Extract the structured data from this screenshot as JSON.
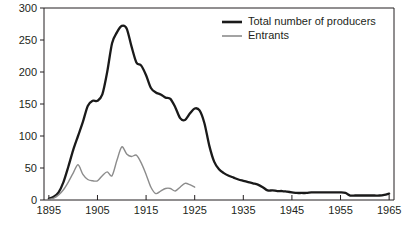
{
  "chart_data": {
    "type": "line",
    "title": "",
    "subtitle": "",
    "xlabel": "",
    "ylabel": "",
    "xlim": [
      1894,
      1966
    ],
    "ylim": [
      0,
      300
    ],
    "grid": false,
    "legend_position": "top-right",
    "x_ticks": [
      "1895",
      "1905",
      "1915",
      "1925",
      "1935",
      "1945",
      "1955",
      "1965"
    ],
    "x_tick_values": [
      1895,
      1905,
      1915,
      1925,
      1935,
      1945,
      1955,
      1965
    ],
    "y_ticks": [
      "0",
      "50",
      "100",
      "150",
      "200",
      "250",
      "300"
    ],
    "y_tick_values": [
      0,
      50,
      100,
      150,
      200,
      250,
      300
    ],
    "x": [
      1895,
      1896,
      1897,
      1898,
      1899,
      1900,
      1901,
      1902,
      1903,
      1904,
      1905,
      1906,
      1907,
      1908,
      1909,
      1910,
      1911,
      1912,
      1913,
      1914,
      1915,
      1916,
      1917,
      1918,
      1919,
      1920,
      1921,
      1922,
      1923,
      1924,
      1925,
      1926,
      1927,
      1928,
      1929,
      1930,
      1931,
      1932,
      1933,
      1934,
      1935,
      1936,
      1937,
      1938,
      1939,
      1940,
      1941,
      1942,
      1943,
      1944,
      1945,
      1946,
      1947,
      1948,
      1949,
      1950,
      1951,
      1952,
      1953,
      1954,
      1955,
      1956,
      1957,
      1958,
      1959,
      1960,
      1961,
      1962,
      1963,
      1964,
      1965
    ],
    "series": [
      {
        "name": "Total number of producers",
        "color": "#1a1a1a",
        "line_width": "thick",
        "values": [
          2,
          5,
          12,
          28,
          52,
          78,
          100,
          122,
          147,
          155,
          155,
          165,
          200,
          245,
          262,
          272,
          268,
          240,
          215,
          210,
          195,
          175,
          168,
          165,
          160,
          158,
          145,
          128,
          125,
          135,
          143,
          140,
          120,
          85,
          60,
          48,
          42,
          38,
          35,
          32,
          30,
          28,
          26,
          24,
          20,
          15,
          15,
          14,
          14,
          13,
          12,
          11,
          11,
          11,
          12,
          12,
          12,
          12,
          12,
          12,
          12,
          11,
          7,
          7,
          7,
          7,
          7,
          7,
          7,
          8,
          10
        ]
      },
      {
        "name": "Entrants",
        "color": "#8c8c8c",
        "line_width": "thin",
        "values": [
          1,
          3,
          8,
          16,
          28,
          42,
          55,
          40,
          32,
          30,
          30,
          38,
          44,
          38,
          62,
          83,
          72,
          68,
          70,
          58,
          40,
          20,
          10,
          14,
          18,
          18,
          14,
          20,
          26,
          24,
          20,
          12,
          17,
          14,
          10,
          14,
          16,
          13,
          9,
          5,
          2,
          0,
          3,
          1,
          0,
          0,
          0,
          0,
          0,
          0,
          0,
          0,
          0,
          0,
          0,
          0,
          0,
          0,
          0,
          0,
          0,
          0,
          0,
          0,
          0,
          0,
          0,
          0,
          0,
          0,
          0
        ]
      }
    ],
    "entrants_end_year": 1925,
    "peak_total": {
      "year": 1910,
      "value": 272
    },
    "peak_entrants": {
      "year": 1910,
      "value": 83
    }
  },
  "legend": {
    "items": [
      {
        "label": "Total number of producers",
        "color": "#1a1a1a"
      },
      {
        "label": "Entrants",
        "color": "#8c8c8c"
      }
    ]
  }
}
